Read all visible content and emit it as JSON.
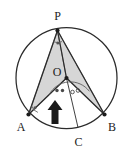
{
  "figure": {
    "background_color": "#ffffff",
    "stroke_color": "#2b2b2b",
    "shade_color": "#d6d6d6",
    "shade_stroke_color": "#6e6e6e",
    "arrow_color": "#1a1a1a",
    "circle": {
      "center_x": 66.5,
      "center_y": 78,
      "radius": 50.5
    },
    "points": [
      {
        "name": "P",
        "label": "P",
        "x": 57.5,
        "y": 30.5,
        "label_x": 57.5,
        "label_y": 20.0,
        "dot": true
      },
      {
        "name": "O",
        "label": "O",
        "x": 66.5,
        "y": 78.0,
        "label_x": 57.0,
        "label_y": 76.0,
        "dot": true
      },
      {
        "name": "A",
        "label": "A",
        "x": 28.5,
        "y": 114.5,
        "label_x": 21.0,
        "label_y": 131.0,
        "dot": true
      },
      {
        "name": "B",
        "label": "B",
        "x": 104.5,
        "y": 114.5,
        "label_x": 112.0,
        "label_y": 131.0,
        "dot": true
      },
      {
        "name": "C",
        "label": "C",
        "x": 78.0,
        "y": 127.5,
        "label_x": 78.5,
        "label_y": 146.0,
        "dot": false
      }
    ],
    "segments": [
      {
        "name": "PA",
        "from": "P",
        "to": "A"
      },
      {
        "name": "PB",
        "from": "P",
        "to": "B"
      },
      {
        "name": "PO",
        "from": "P",
        "to": "O"
      },
      {
        "name": "OA",
        "from": "O",
        "to": "A"
      },
      {
        "name": "OB",
        "from": "O",
        "to": "B"
      },
      {
        "name": "OC",
        "from": "O",
        "to": "C"
      }
    ],
    "shaded_regions": [
      {
        "name": "triangle-P-A-O",
        "vertices": [
          "P",
          "A",
          "O"
        ]
      },
      {
        "name": "triangle-P-O-B",
        "vertices": [
          "P",
          "O",
          "B"
        ]
      }
    ],
    "angle_marks": [
      {
        "name": "angle-at-P",
        "vertex": "P",
        "style": "arc-with-dot",
        "radius": 11
      },
      {
        "name": "angle-at-A",
        "vertex": "A",
        "style": "arc-with-dot",
        "radius": 9
      },
      {
        "name": "angle-AOC",
        "vertex": "O",
        "style": "arc-two-dots",
        "radius": 24
      },
      {
        "name": "angle-COB",
        "vertex": "O",
        "style": "arc-two-rings",
        "radius": 24
      }
    ],
    "arrow": {
      "name": "up-arrow",
      "direction": "up",
      "tip_x": 55.0,
      "tip_y": 101.0,
      "tail_y": 124.0,
      "width": 13
    }
  }
}
